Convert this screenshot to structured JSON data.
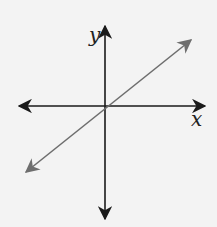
{
  "diagram": {
    "type": "coordinate-plane",
    "x_label": "x",
    "y_label": "y",
    "line": {
      "description": "line through origin with positive slope",
      "color": "#6e6e6e"
    },
    "axis_color": "#1a1a1a"
  }
}
